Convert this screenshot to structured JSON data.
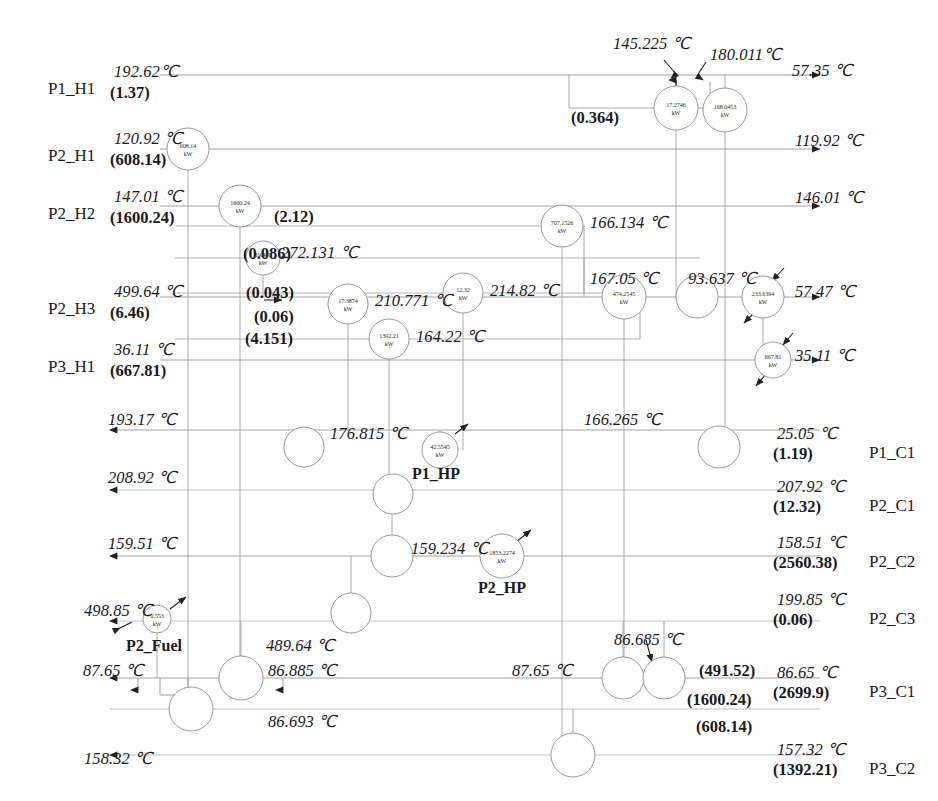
{
  "diagram": {
    "units": "℃",
    "duty_units": "kW"
  },
  "streams": [
    {
      "id": "P1_H1",
      "label": "P1_H1",
      "x": 48,
      "y": 80,
      "temp": "192.62℃",
      "flow": "(1.37)",
      "side": "left"
    },
    {
      "id": "P2_H1",
      "label": "P2_H1",
      "x": 48,
      "y": 147,
      "temp": "120.92 ℃",
      "flow": "(608.14)",
      "side": "left"
    },
    {
      "id": "P2_H2",
      "label": "P2_H2",
      "x": 48,
      "y": 205,
      "temp": "147.01 ℃",
      "flow": "(1600.24)",
      "side": "left"
    },
    {
      "id": "P2_H3",
      "label": "P2_H3",
      "x": 48,
      "y": 300,
      "temp": "499.64 ℃",
      "flow": "(6.46)",
      "side": "left"
    },
    {
      "id": "P3_H1",
      "label": "P3_H1",
      "x": 48,
      "y": 358,
      "temp": "36.11 ℃",
      "flow": "(667.81)",
      "side": "left"
    },
    {
      "id": "P1_C1",
      "label": "P1_C1",
      "x": 869,
      "y": 444,
      "temp": "25.05 ℃",
      "flow": "(1.19)",
      "side": "right"
    },
    {
      "id": "P2_C1",
      "label": "P2_C1",
      "x": 869,
      "y": 497,
      "temp": "207.92 ℃",
      "flow": "(12.32)",
      "side": "right"
    },
    {
      "id": "P2_C2",
      "label": "P2_C2",
      "x": 869,
      "y": 553,
      "temp": "158.51 ℃",
      "flow": "(2560.38)",
      "side": "right"
    },
    {
      "id": "P2_C3",
      "label": "P2_C3",
      "x": 869,
      "y": 610,
      "temp": "199.85 ℃",
      "flow": "(0.06)",
      "side": "right"
    },
    {
      "id": "P3_C1",
      "label": "P3_C1",
      "x": 869,
      "y": 683,
      "temp": "86.65 ℃",
      "flow": "(2699.9)",
      "side": "right"
    },
    {
      "id": "P3_C2",
      "label": "P3_C2",
      "x": 869,
      "y": 760,
      "temp": "157.32 ℃",
      "flow": "(1392.21)",
      "side": "right"
    }
  ],
  "units_named": [
    {
      "name": "P1_HP",
      "x": 412,
      "y": 466
    },
    {
      "name": "P2_HP",
      "x": 478,
      "y": 580
    },
    {
      "name": "P2_Fuel",
      "x": 126,
      "y": 638
    }
  ],
  "exchangers": [
    {
      "id": "hx-608",
      "duty": "608.14",
      "unit": "kW",
      "cx": 188,
      "cy": 149,
      "r": 21
    },
    {
      "id": "hx-1600",
      "duty": "1600.24",
      "unit": "kW",
      "cx": 240,
      "cy": 206,
      "r": 21
    },
    {
      "id": "hx-19",
      "duty": "19.463",
      "unit": "kW",
      "cx": 263,
      "cy": 258,
      "r": 17
    },
    {
      "id": "hx-17p3",
      "duty": "17.3874",
      "unit": "kW",
      "cx": 348,
      "cy": 304,
      "r": 20
    },
    {
      "id": "hx-1392",
      "duty": "1392.21",
      "unit": "kW",
      "cx": 389,
      "cy": 339,
      "r": 20
    },
    {
      "id": "hx-12p3",
      "duty": "12.32",
      "unit": "kW",
      "cx": 463,
      "cy": 293,
      "r": 20
    },
    {
      "id": "hx-707",
      "duty": "707.1526",
      "unit": "kW",
      "cx": 562,
      "cy": 226,
      "r": 21
    },
    {
      "id": "hx-17p2",
      "duty": "17.2746",
      "unit": "kW",
      "cx": 676,
      "cy": 108,
      "r": 22
    },
    {
      "id": "hx-168",
      "duty": "168.0453",
      "unit": "kW",
      "cx": 725,
      "cy": 110,
      "r": 22
    },
    {
      "id": "hx-474",
      "duty": "474.2545",
      "unit": "kW",
      "cx": 624,
      "cy": 297,
      "r": 22
    },
    {
      "id": "hx-233",
      "duty": "233.6394",
      "unit": "kW",
      "cx": 763,
      "cy": 297,
      "r": 21
    },
    {
      "id": "hx-667",
      "duty": "667.81",
      "unit": "kW",
      "cx": 773,
      "cy": 360,
      "r": 18
    },
    {
      "id": "hx-42",
      "duty": "42.5545",
      "unit": "kW",
      "cx": 440,
      "cy": 450,
      "r": 18
    },
    {
      "id": "hx-1853",
      "duty": "1853.2274",
      "unit": "kW",
      "cx": 502,
      "cy": 556,
      "r": 22
    },
    {
      "id": "hx-0p553",
      "duty": "0.553",
      "unit": "kW",
      "cx": 157,
      "cy": 619,
      "r": 14
    }
  ],
  "blank_nodes": [
    {
      "id": "n1",
      "cx": 304,
      "cy": 447,
      "r": 20
    },
    {
      "id": "n2",
      "cx": 719,
      "cy": 447,
      "r": 21
    },
    {
      "id": "n3",
      "cx": 393,
      "cy": 494,
      "r": 20
    },
    {
      "id": "n4",
      "cx": 697,
      "cy": 297,
      "r": 21
    },
    {
      "id": "n5",
      "cx": 392,
      "cy": 556,
      "r": 21
    },
    {
      "id": "n6",
      "cx": 351,
      "cy": 613,
      "r": 20
    },
    {
      "id": "n7",
      "cx": 241,
      "cy": 678,
      "r": 22
    },
    {
      "id": "n8",
      "cx": 191,
      "cy": 709,
      "r": 22
    },
    {
      "id": "n9",
      "cx": 623,
      "cy": 678,
      "r": 21
    },
    {
      "id": "n10",
      "cx": 664,
      "cy": 678,
      "r": 21
    },
    {
      "id": "n11",
      "cx": 573,
      "cy": 755,
      "r": 22
    }
  ],
  "temperatures": [
    {
      "id": "t-145",
      "text": "145.225 ℃",
      "x": 613,
      "y": 36
    },
    {
      "id": "t-180",
      "text": "180.011℃",
      "x": 710,
      "y": 47
    },
    {
      "id": "t-5735",
      "text": "57.35 ℃",
      "x": 792,
      "y": 63
    },
    {
      "id": "t-11992",
      "text": "119.92 ℃",
      "x": 795,
      "y": 133
    },
    {
      "id": "t-14601",
      "text": "146.01 ℃",
      "x": 795,
      "y": 190
    },
    {
      "id": "t-166134",
      "text": "166.134 ℃",
      "x": 590,
      "y": 215
    },
    {
      "id": "t-272131",
      "text": "272.131 ℃",
      "x": 281,
      "y": 245
    },
    {
      "id": "t-21482",
      "text": "214.82 ℃",
      "x": 490,
      "y": 283
    },
    {
      "id": "t-210771",
      "text": "210.771 ℃",
      "x": 375,
      "y": 293
    },
    {
      "id": "t-16422",
      "text": "164.22 ℃",
      "x": 416,
      "y": 329
    },
    {
      "id": "t-16705",
      "text": "167.05 ℃",
      "x": 590,
      "y": 271
    },
    {
      "id": "t-93637",
      "text": "93.637 ℃",
      "x": 688,
      "y": 271
    },
    {
      "id": "t-5747",
      "text": "57.47 ℃",
      "x": 795,
      "y": 284
    },
    {
      "id": "t-3511",
      "text": "35.11 ℃",
      "x": 795,
      "y": 348
    },
    {
      "id": "t-19317",
      "text": "193.17 ℃",
      "x": 108,
      "y": 412
    },
    {
      "id": "t-176815",
      "text": "176.815 ℃",
      "x": 330,
      "y": 426
    },
    {
      "id": "t-166265",
      "text": "166.265 ℃",
      "x": 584,
      "y": 412
    },
    {
      "id": "t-20892",
      "text": "208.92 ℃",
      "x": 108,
      "y": 470
    },
    {
      "id": "t-15951",
      "text": "159.51 ℃",
      "x": 108,
      "y": 536
    },
    {
      "id": "t-159234",
      "text": "159.234 ℃",
      "x": 411,
      "y": 541
    },
    {
      "id": "t-49885",
      "text": "498.85 ℃",
      "x": 84,
      "y": 603
    },
    {
      "id": "t-48964",
      "text": "489.64 ℃",
      "x": 266,
      "y": 638
    },
    {
      "id": "t-86685",
      "text": "86.685 ℃",
      "x": 614,
      "y": 632
    },
    {
      "id": "t-8765L",
      "text": "87.65 ℃",
      "x": 83,
      "y": 663
    },
    {
      "id": "t-86885",
      "text": "86.885 ℃",
      "x": 268,
      "y": 663
    },
    {
      "id": "t-8765M",
      "text": "87.65 ℃",
      "x": 512,
      "y": 663
    },
    {
      "id": "t-86693",
      "text": "86.693 ℃",
      "x": 268,
      "y": 714
    },
    {
      "id": "t-15832",
      "text": "158.32 ℃",
      "x": 84,
      "y": 751
    }
  ],
  "flows": [
    {
      "id": "f-0364",
      "text": "(0.364)",
      "x": 571,
      "y": 110
    },
    {
      "id": "f-212",
      "text": "(2.12)",
      "x": 274,
      "y": 209
    },
    {
      "id": "f-0086",
      "text": "(0.086)",
      "x": 243,
      "y": 246
    },
    {
      "id": "f-0043",
      "text": "(0.043)",
      "x": 246,
      "y": 285
    },
    {
      "id": "f-006",
      "text": "(0.06)",
      "x": 254,
      "y": 309
    },
    {
      "id": "f-4151",
      "text": "(4.151)",
      "x": 245,
      "y": 331
    },
    {
      "id": "f-49152",
      "text": "(491.52)",
      "x": 699,
      "y": 663
    },
    {
      "id": "f-160024",
      "text": "(1600.24)",
      "x": 687,
      "y": 692
    },
    {
      "id": "f-60814",
      "text": "(608.14)",
      "x": 696,
      "y": 719
    }
  ]
}
